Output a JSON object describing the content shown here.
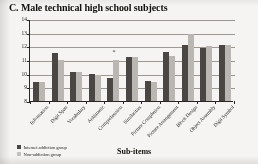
{
  "chart_data": {
    "type": "bar",
    "title": "C. Male technical high school subjects",
    "xlabel": "Sub-items",
    "ylabel": "scores",
    "ylim": [
      8,
      14
    ],
    "yticks": [
      8,
      9,
      10,
      11,
      12,
      13,
      14
    ],
    "grid": true,
    "legend_position": "bottom-left",
    "categories": [
      "Information",
      "Digit Span",
      "Vocabulary",
      "Arithmetic",
      "Comprehension",
      "Similarities",
      "Picture Completion",
      "Picture Arrangement",
      "Block Design",
      "Object Assembly",
      "Digit Symbol"
    ],
    "series": [
      {
        "name": "Internet addiction group",
        "color": "#4a4744",
        "values": [
          9.4,
          11.5,
          10.1,
          10.0,
          9.65,
          11.2,
          9.45,
          11.6,
          12.1,
          11.9,
          12.1
        ]
      },
      {
        "name": "Non-addiction group",
        "color": "#b9b5b0",
        "values": [
          9.4,
          11.0,
          10.1,
          9.9,
          11.0,
          11.25,
          9.4,
          11.3,
          12.9,
          12.05,
          12.1
        ]
      }
    ],
    "annotations": [
      {
        "text": "*",
        "category": "Comprehension",
        "value": 11.9
      }
    ]
  }
}
